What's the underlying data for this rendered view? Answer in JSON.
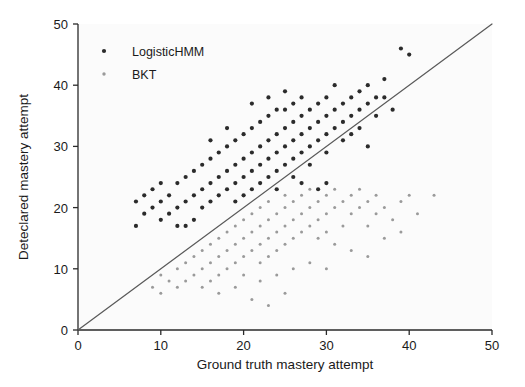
{
  "chart_data": {
    "type": "scatter",
    "title": "",
    "xlabel": "Ground truth mastery attempt",
    "ylabel": "Deteclared mastery attempt",
    "xlim": [
      0,
      50
    ],
    "ylim": [
      0,
      50
    ],
    "xticks": [
      0,
      10,
      20,
      30,
      40,
      50
    ],
    "yticks": [
      0,
      10,
      20,
      30,
      40,
      50
    ],
    "grid": false,
    "legend_position": "upper left",
    "reference_line": {
      "name": "identity-line",
      "from": [
        0,
        0
      ],
      "to": [
        50,
        50
      ],
      "color": "#5a5a5a"
    },
    "series": [
      {
        "name": "LogisticHMM",
        "marker": "circle",
        "color": "#2b2b2b",
        "size": 4.2,
        "points": [
          [
            7,
            21
          ],
          [
            7,
            17
          ],
          [
            8,
            22
          ],
          [
            8,
            19
          ],
          [
            9,
            23
          ],
          [
            9,
            20
          ],
          [
            10,
            24
          ],
          [
            10,
            21
          ],
          [
            10,
            18
          ],
          [
            11,
            22
          ],
          [
            11,
            19
          ],
          [
            12,
            24
          ],
          [
            12,
            20
          ],
          [
            13,
            25
          ],
          [
            13,
            21
          ],
          [
            13,
            17
          ],
          [
            14,
            22
          ],
          [
            14,
            26
          ],
          [
            15,
            23
          ],
          [
            15,
            27
          ],
          [
            15,
            20
          ],
          [
            16,
            24
          ],
          [
            16,
            28
          ],
          [
            16,
            21
          ],
          [
            17,
            25
          ],
          [
            17,
            22
          ],
          [
            17,
            29
          ],
          [
            18,
            26
          ],
          [
            18,
            23
          ],
          [
            18,
            30
          ],
          [
            19,
            27
          ],
          [
            19,
            24
          ],
          [
            19,
            31
          ],
          [
            19,
            21
          ],
          [
            20,
            28
          ],
          [
            20,
            25
          ],
          [
            20,
            32
          ],
          [
            20,
            22
          ],
          [
            21,
            29
          ],
          [
            21,
            26
          ],
          [
            21,
            23
          ],
          [
            21,
            33
          ],
          [
            22,
            30
          ],
          [
            22,
            27
          ],
          [
            22,
            24
          ],
          [
            22,
            34
          ],
          [
            23,
            31
          ],
          [
            23,
            28
          ],
          [
            23,
            25
          ],
          [
            23,
            35
          ],
          [
            24,
            32
          ],
          [
            24,
            29
          ],
          [
            24,
            26
          ],
          [
            24,
            23
          ],
          [
            25,
            33
          ],
          [
            25,
            30
          ],
          [
            25,
            27
          ],
          [
            25,
            36
          ],
          [
            26,
            34
          ],
          [
            26,
            31
          ],
          [
            26,
            28
          ],
          [
            26,
            25
          ],
          [
            27,
            35
          ],
          [
            27,
            32
          ],
          [
            27,
            29
          ],
          [
            27,
            38
          ],
          [
            28,
            36
          ],
          [
            28,
            33
          ],
          [
            28,
            30
          ],
          [
            28,
            27
          ],
          [
            29,
            37
          ],
          [
            29,
            34
          ],
          [
            29,
            31
          ],
          [
            30,
            38
          ],
          [
            30,
            35
          ],
          [
            30,
            32
          ],
          [
            30,
            29
          ],
          [
            31,
            36
          ],
          [
            31,
            33
          ],
          [
            31,
            40
          ],
          [
            32,
            37
          ],
          [
            32,
            34
          ],
          [
            32,
            31
          ],
          [
            33,
            38
          ],
          [
            33,
            35
          ],
          [
            34,
            39
          ],
          [
            34,
            36
          ],
          [
            34,
            33
          ],
          [
            35,
            40
          ],
          [
            35,
            37
          ],
          [
            36,
            38
          ],
          [
            36,
            35
          ],
          [
            37,
            41
          ],
          [
            37,
            38
          ],
          [
            38,
            36
          ],
          [
            39,
            46
          ],
          [
            40,
            45
          ],
          [
            30,
            24
          ],
          [
            29,
            23
          ],
          [
            14,
            18
          ],
          [
            12,
            17
          ],
          [
            23,
            38
          ],
          [
            25,
            39
          ],
          [
            21,
            37
          ],
          [
            18,
            33
          ],
          [
            16,
            31
          ],
          [
            33,
            32
          ],
          [
            35,
            30
          ],
          [
            27,
            24
          ],
          [
            24,
            36
          ],
          [
            26,
            37
          ]
        ]
      },
      {
        "name": "BKT",
        "marker": "circle",
        "color": "#9a9a9a",
        "size": 3.0,
        "points": [
          [
            9,
            7
          ],
          [
            10,
            9
          ],
          [
            10,
            6
          ],
          [
            11,
            8
          ],
          [
            12,
            10
          ],
          [
            12,
            7
          ],
          [
            13,
            11
          ],
          [
            13,
            8
          ],
          [
            14,
            12
          ],
          [
            14,
            9
          ],
          [
            15,
            13
          ],
          [
            15,
            10
          ],
          [
            15,
            7
          ],
          [
            16,
            14
          ],
          [
            16,
            11
          ],
          [
            16,
            8
          ],
          [
            17,
            15
          ],
          [
            17,
            12
          ],
          [
            17,
            9
          ],
          [
            18,
            16
          ],
          [
            18,
            13
          ],
          [
            18,
            10
          ],
          [
            19,
            17
          ],
          [
            19,
            14
          ],
          [
            19,
            11
          ],
          [
            20,
            18
          ],
          [
            20,
            15
          ],
          [
            20,
            12
          ],
          [
            20,
            9
          ],
          [
            21,
            19
          ],
          [
            21,
            16
          ],
          [
            21,
            13
          ],
          [
            22,
            20
          ],
          [
            22,
            17
          ],
          [
            22,
            14
          ],
          [
            22,
            11
          ],
          [
            23,
            21
          ],
          [
            23,
            18
          ],
          [
            23,
            15
          ],
          [
            23,
            12
          ],
          [
            24,
            19
          ],
          [
            24,
            16
          ],
          [
            24,
            13
          ],
          [
            25,
            22
          ],
          [
            25,
            20
          ],
          [
            25,
            17
          ],
          [
            25,
            14
          ],
          [
            26,
            21
          ],
          [
            26,
            18
          ],
          [
            26,
            15
          ],
          [
            27,
            22
          ],
          [
            27,
            19
          ],
          [
            27,
            16
          ],
          [
            28,
            23
          ],
          [
            28,
            20
          ],
          [
            28,
            17
          ],
          [
            29,
            21
          ],
          [
            29,
            18
          ],
          [
            29,
            15
          ],
          [
            30,
            24
          ],
          [
            30,
            22
          ],
          [
            30,
            19
          ],
          [
            30,
            16
          ],
          [
            31,
            23
          ],
          [
            31,
            20
          ],
          [
            32,
            21
          ],
          [
            32,
            17
          ],
          [
            33,
            22
          ],
          [
            33,
            19
          ],
          [
            34,
            23
          ],
          [
            34,
            20
          ],
          [
            35,
            21
          ],
          [
            35,
            17
          ],
          [
            36,
            22
          ],
          [
            36,
            19
          ],
          [
            37,
            20
          ],
          [
            38,
            18
          ],
          [
            39,
            21
          ],
          [
            40,
            22
          ],
          [
            41,
            19
          ],
          [
            43,
            22
          ],
          [
            24,
            9
          ],
          [
            26,
            10
          ],
          [
            22,
            8
          ],
          [
            19,
            7
          ],
          [
            17,
            6
          ],
          [
            31,
            14
          ],
          [
            33,
            13
          ],
          [
            35,
            12
          ],
          [
            28,
            11
          ],
          [
            30,
            10
          ],
          [
            21,
            5
          ],
          [
            25,
            6
          ],
          [
            23,
            4
          ],
          [
            37,
            15
          ],
          [
            39,
            16
          ]
        ]
      }
    ]
  },
  "legend": {
    "items": [
      {
        "label": "LogisticHMM"
      },
      {
        "label": "BKT"
      }
    ]
  }
}
